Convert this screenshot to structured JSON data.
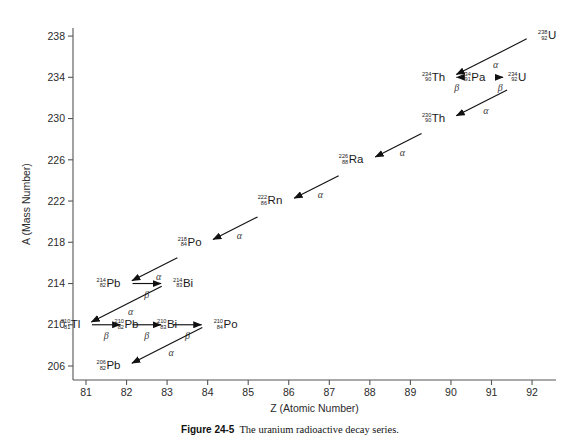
{
  "figure": {
    "caption_label": "Figure 24-5",
    "caption_text": "The uranium radioactive decay series.",
    "axis_color": "#555555",
    "line_color": "#111111",
    "background": "#ffffff"
  },
  "chart_data": {
    "type": "scatter",
    "title": "The uranium radioactive decay series",
    "xlabel": "Z (Atomic Number)",
    "ylabel": "A (Mass Number)",
    "xlim": [
      80.5,
      92.4
    ],
    "ylim": [
      204.6,
      239.5
    ],
    "xticks": [
      81,
      82,
      83,
      84,
      85,
      86,
      87,
      88,
      89,
      90,
      91,
      92
    ],
    "yticks": [
      206,
      210,
      214,
      218,
      222,
      226,
      230,
      234,
      238
    ],
    "grid": false,
    "legend": null,
    "nuclides": [
      {
        "name": "U-238",
        "element": "U",
        "mass": 238,
        "atomic": 92,
        "label_side": "right"
      },
      {
        "name": "Th-234",
        "element": "Th",
        "mass": 234,
        "atomic": 90,
        "label_side": "left"
      },
      {
        "name": "Pa-234",
        "element": "Pa",
        "mass": 234,
        "atomic": 91,
        "label_side": "left"
      },
      {
        "name": "U-234",
        "element": "U",
        "mass": 234,
        "atomic": 92,
        "label_side": "left"
      },
      {
        "name": "Th-230",
        "element": "Th",
        "mass": 230,
        "atomic": 90,
        "label_side": "left"
      },
      {
        "name": "Ra-226",
        "element": "Ra",
        "mass": 226,
        "atomic": 88,
        "label_side": "left"
      },
      {
        "name": "Rn-222",
        "element": "Rn",
        "mass": 222,
        "atomic": 86,
        "label_side": "left"
      },
      {
        "name": "Po-218",
        "element": "Po",
        "mass": 218,
        "atomic": 84,
        "label_side": "left"
      },
      {
        "name": "Pb-214",
        "element": "Pb",
        "mass": 214,
        "atomic": 82,
        "label_side": "left"
      },
      {
        "name": "Bi-214",
        "element": "Bi",
        "mass": 214,
        "atomic": 83,
        "label_side": "right"
      },
      {
        "name": "Tl-210",
        "element": "Tl",
        "mass": 210,
        "atomic": 81,
        "label_side": "left"
      },
      {
        "name": "Pb-210",
        "element": "Pb",
        "mass": 210,
        "atomic": 82,
        "label_side": "center"
      },
      {
        "name": "Bi-210",
        "element": "Bi",
        "mass": 210,
        "atomic": 83,
        "label_side": "center"
      },
      {
        "name": "Po-210",
        "element": "Po",
        "mass": 210,
        "atomic": 84,
        "label_side": "right"
      },
      {
        "name": "Pb-206",
        "element": "Pb",
        "mass": 206,
        "atomic": 82,
        "label_side": "left"
      }
    ],
    "decays": [
      {
        "from": "U-238",
        "to": "Th-234",
        "type": "alpha",
        "symbol": "α"
      },
      {
        "from": "Th-234",
        "to": "Pa-234",
        "type": "beta",
        "symbol": "β"
      },
      {
        "from": "Pa-234",
        "to": "U-234",
        "type": "beta",
        "symbol": "β"
      },
      {
        "from": "U-234",
        "to": "Th-230",
        "type": "alpha",
        "symbol": "α"
      },
      {
        "from": "Th-230",
        "to": "Ra-226",
        "type": "alpha",
        "symbol": "α"
      },
      {
        "from": "Ra-226",
        "to": "Rn-222",
        "type": "alpha",
        "symbol": "α"
      },
      {
        "from": "Rn-222",
        "to": "Po-218",
        "type": "alpha",
        "symbol": "α"
      },
      {
        "from": "Po-218",
        "to": "Pb-214",
        "type": "alpha",
        "symbol": "α"
      },
      {
        "from": "Pb-214",
        "to": "Bi-214",
        "type": "beta",
        "symbol": "β"
      },
      {
        "from": "Bi-214",
        "to": "Tl-210",
        "type": "alpha",
        "symbol": "α"
      },
      {
        "from": "Tl-210",
        "to": "Pb-210",
        "type": "beta",
        "symbol": "β"
      },
      {
        "from": "Pb-210",
        "to": "Bi-210",
        "type": "beta",
        "symbol": "β"
      },
      {
        "from": "Bi-210",
        "to": "Po-210",
        "type": "beta",
        "symbol": "β"
      },
      {
        "from": "Po-210",
        "to": "Pb-206",
        "type": "alpha",
        "symbol": "α"
      }
    ]
  }
}
